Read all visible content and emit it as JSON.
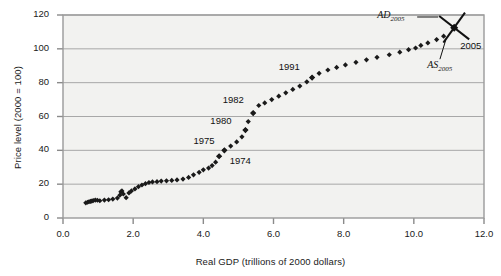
{
  "chart_data": {
    "type": "scatter",
    "title": "",
    "xlabel": "Real GDP (trillions of 2000 dollars)",
    "ylabel": "Price level (2000 = 100)",
    "xlim": [
      0.0,
      12.0
    ],
    "ylim": [
      0,
      120
    ],
    "xticks": [
      "0.0",
      "2.0",
      "4.0",
      "6.0",
      "8.0",
      "10.0",
      "12.0"
    ],
    "xtick_values": [
      0.0,
      2.0,
      4.0,
      6.0,
      8.0,
      10.0,
      12.0
    ],
    "yticks": [
      "0",
      "20",
      "40",
      "60",
      "80",
      "100",
      "120"
    ],
    "ytick_values": [
      0,
      20,
      40,
      60,
      80,
      100,
      120
    ],
    "grid": "horizontal",
    "legend": "none",
    "marker": "diamond",
    "marker_color": "#1a1a1a",
    "series": [
      {
        "name": "Aggregate demand and supply equilibrium points",
        "x": [
          0.65,
          0.7,
          0.74,
          0.78,
          0.82,
          0.86,
          0.92,
          0.98,
          1.05,
          1.18,
          1.3,
          1.42,
          1.55,
          1.62,
          1.65,
          1.68,
          1.72,
          1.8,
          1.88,
          1.95,
          2.05,
          2.15,
          2.25,
          2.35,
          2.45,
          2.55,
          2.68,
          2.8,
          2.95,
          3.1,
          3.25,
          3.42,
          3.58,
          3.72,
          3.88,
          4.0,
          4.15,
          4.25,
          4.35,
          4.45,
          4.6,
          4.78,
          4.95,
          5.1,
          5.2,
          5.28,
          5.42,
          5.58,
          5.75,
          5.95,
          6.15,
          6.35,
          6.55,
          6.75,
          6.95,
          7.1,
          7.3,
          7.55,
          7.8,
          8.05,
          8.35,
          8.65,
          8.95,
          9.3,
          9.6,
          9.85,
          10.05,
          10.2,
          10.4,
          10.65,
          10.85
        ],
        "y": [
          9.0,
          9.3,
          9.6,
          9.8,
          10.0,
          10.3,
          10.6,
          10.5,
          10.2,
          10.6,
          10.8,
          11.2,
          11.8,
          13.5,
          15.5,
          16.0,
          14.2,
          12.0,
          14.8,
          16.0,
          17.2,
          18.5,
          19.5,
          20.3,
          21.0,
          21.3,
          21.5,
          21.8,
          22.0,
          22.2,
          22.5,
          23.0,
          24.0,
          25.5,
          27.0,
          28.5,
          29.5,
          31.0,
          33.0,
          36.5,
          40.0,
          42.5,
          45.0,
          48.0,
          52.0,
          57.0,
          62.0,
          66.5,
          68.0,
          70.0,
          72.0,
          74.0,
          76.0,
          78.0,
          80.5,
          83.0,
          85.5,
          87.5,
          89.0,
          90.5,
          92.0,
          93.5,
          95.0,
          96.5,
          98.0,
          99.5,
          100.5,
          102.0,
          103.5,
          105.5,
          107.5
        ]
      }
    ],
    "point_labels": [
      {
        "text": "1974",
        "x": 4.45,
        "y": 36.5,
        "label_x": 4.75,
        "label_y": 33.0
      },
      {
        "text": "1975",
        "x": 4.6,
        "y": 40.0,
        "label_x": 3.72,
        "label_y": 45.0
      },
      {
        "text": "1980",
        "x": 5.2,
        "y": 52.0,
        "label_x": 4.2,
        "label_y": 57.0
      },
      {
        "text": "1982",
        "x": 5.42,
        "y": 62.0,
        "label_x": 4.55,
        "label_y": 69.0
      },
      {
        "text": "1991",
        "x": 7.1,
        "y": 83.0,
        "label_x": 6.15,
        "label_y": 88.5
      }
    ],
    "annotations": {
      "equilibrium_point": {
        "x": 11.15,
        "y": 112.5
      },
      "ad_label": "AD",
      "ad_subscript": "2005",
      "as_label": "AS",
      "as_subscript": "2005",
      "year_label": "2005"
    }
  }
}
